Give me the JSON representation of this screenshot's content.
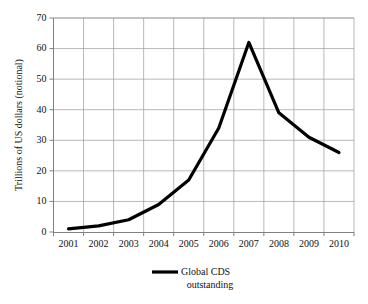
{
  "chart_data": {
    "type": "line",
    "title": "",
    "xlabel": "",
    "ylabel": "Trillions of US dollars (notional)",
    "categories": [
      "2001",
      "2002",
      "2003",
      "2004",
      "2005",
      "2006",
      "2007",
      "2008",
      "2009",
      "2010"
    ],
    "x": [
      2001,
      2002,
      2003,
      2004,
      2005,
      2006,
      2007,
      2008,
      2009,
      2010
    ],
    "series": [
      {
        "name": "Global CDS outstanding",
        "values": [
          1,
          2,
          4,
          9,
          17,
          34,
          62,
          39,
          31,
          26
        ],
        "color": "#000000"
      }
    ],
    "ylim": [
      0,
      70
    ],
    "yticks": [
      0,
      10,
      20,
      30,
      40,
      50,
      60,
      70
    ],
    "ytick_labels": [
      "0",
      "10",
      "20",
      "30",
      "40",
      "50",
      "60",
      "70"
    ],
    "xtick_labels": [
      "2001",
      "2002",
      "2003",
      "2004",
      "2005",
      "2006",
      "2007",
      "2008",
      "2009",
      "2010"
    ],
    "grid": true,
    "grid_axis": "both",
    "legend_position": "bottom-center",
    "legend_entries": [
      {
        "line1": "Global CDS",
        "line2": "outstanding",
        "color": "#000000"
      }
    ]
  },
  "colors": {
    "background": "#ffffff",
    "series": "#000000",
    "grid": "#9a9a9a",
    "axis": "#808080",
    "text": "#111111"
  },
  "legend": {
    "label_line1": "Global CDS",
    "label_line2": "outstanding"
  },
  "axes": {
    "y_title": "Trillions of US dollars (notional)"
  }
}
